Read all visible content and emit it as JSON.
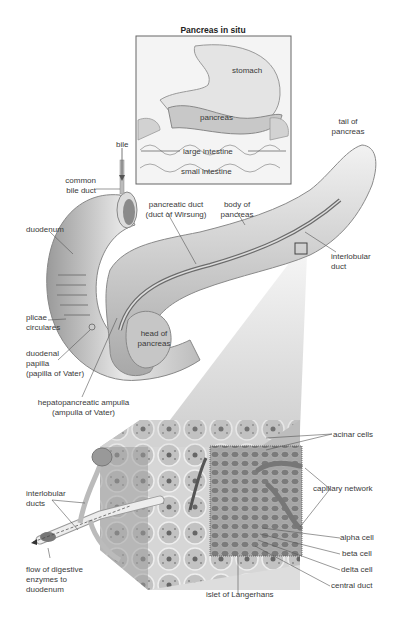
{
  "figure": {
    "inset": {
      "title": "Pancreas in situ",
      "labels": [
        "stomach",
        "pancreas",
        "large intestine",
        "small intestine"
      ]
    },
    "main_labels": {
      "bile": "bile",
      "common_bile_duct": [
        "common",
        "bile duct"
      ],
      "duodenum": "duodenum",
      "pancreatic_duct": [
        "pancreatic duct",
        "(duct of Wirsung)"
      ],
      "body_of_pancreas": [
        "body of",
        "pancreas"
      ],
      "tail_of_pancreas": [
        "tail of",
        "pancreas"
      ],
      "interlobular_duct": [
        "interlobular",
        "duct"
      ],
      "plicae_circulares": [
        "plicae",
        "circulares"
      ],
      "head_of_pancreas": [
        "head of",
        "pancreas"
      ],
      "duodenal_papilla": [
        "duodenal",
        "papilla",
        "(papilla of Vater)"
      ],
      "hepatopancreatic_ampulla": [
        "hepatopancreatic ampulla",
        "(ampulla of Vater)"
      ]
    },
    "detail_labels": {
      "acinar_cells": "acinar cells",
      "capillary_network": "capillary network",
      "interlobular_ducts": [
        "interlobular",
        "ducts"
      ],
      "flow_of_enzymes": [
        "flow of digestive",
        "enzymes to",
        "duodenum"
      ],
      "alpha_cell": "alpha cell",
      "beta_cell": "beta cell",
      "delta_cell": "delta cell",
      "central_duct": "central duct",
      "islet": "islet of Langerhans"
    },
    "colors": {
      "line": "#555555",
      "tissue_light": "#e6e6e6",
      "tissue_mid": "#bdbdbd",
      "tissue_dark": "#7a7a7a",
      "frame": "#666666"
    }
  }
}
